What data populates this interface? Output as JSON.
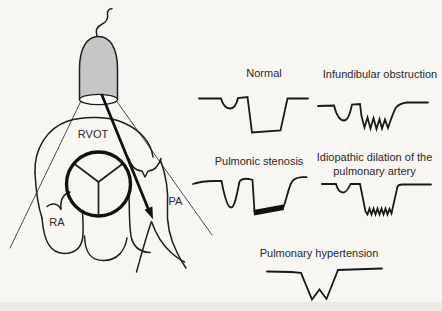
{
  "palette": {
    "background": "#f7f6f3",
    "ink": "#1e1e1e",
    "text": "#2a2a2a",
    "probe_fill": "#c6c6c6"
  },
  "heart_diagram": {
    "labels": {
      "rvot": "RVOT",
      "ra": "RA",
      "pa": "PA"
    },
    "paths": {
      "probe_body": "M 79.5,99 L 79.5,69 C 79.5,48 87,36.5 98.5,36.5 C 110,36.5 117.5,48 117.5,69 L 117.5,99 Z",
      "probe_face": "M 79.5,99.5 A 19,5.2 0 1 0 117.5,99.5 A 19,5.2 0 1 0 79.5,99.5 Z",
      "probe_cable": "M 97,36 C 95,30 97.5,26.5 101.5,24.5 C 106.5,22 108.5,18.5 107.5,14 C 107,11 109,9 112,8.5",
      "beam_left": "M 81,101 L 10,248",
      "beam_right": "M 116.5,101 L 212,235",
      "arrow_shaft": "M 101.5,94 L 149.5,212",
      "arrow_head": "M 153,219.3 L 152.4,206.6 L 144.6,209.8 Z",
      "heart_dome": "M 35,173 C 34,149 47,128 68,121 C 83,116 110,116 124,123 C 140,130 151,142 153,157",
      "heart_left_wall": "M 35,173 C 36,193 38,206 42,218",
      "ra_lobe": "M 42,218 C 44,243 51,253 64,253.5 C 76.5,253.5 82.5,246 83,234 C 83.3,227 83,220 82.5,213",
      "rv_lobe": "M 84.5,236 C 85,253 91,260.5 103.5,260.5 C 117,260.5 125,251 127,238",
      "rv_right_edge": "M 129,192 C 129.5,210 129,225 131,236 C 133,247 140,252 150,252.5",
      "left_scallop": "M 70,192 C 62.5,194.5 60,201 61,209.5 C 57.5,203 51.5,202.5 47,206.5",
      "right_scallop": "M 128.5,158 C 131.5,167 136.5,171 142,171 L 145,177 L 148,171 C 154,171 158.5,166 161,158.5",
      "pa_notch": "M 136.5,272 C 141,256 146,237 151.5,221.5 C 155.5,233 162,244.5 171,252.5 C 175,256 179.5,259.5 184.5,262",
      "pa_outer_wall": "M 160.5,160 C 166.5,177 168.5,192 167.5,206.5 C 166.5,221 170,239 177.5,253.5 C 179.5,257.5 182.5,263 186,268",
      "valve_cusps": "M 98.5,182 L 74,163.5 M 98.5,182 L 123,163.5 M 98.5,182 L 98.5,216"
    },
    "valve_circle": {
      "cx": 98.5,
      "cy": 184,
      "r": 32
    }
  },
  "tracings": [
    {
      "id": "normal",
      "label": "Normal",
      "path": "M 199,98.5 L 221,98.5 C 223,105.5 226,108.5 230,108.5 C 234,108.5 236.5,105 238,98 L 247.5,97 L 252,132.5 L 280.5,130.5 L 287.5,98.5 L 308,98.5"
    },
    {
      "id": "infundibular-obstruction",
      "label": "Infundibular obstruction",
      "path": "M 318,106 L 334,105.5 C 336,113.5 339.5,120.5 344,120.5 C 348.5,120.5 350.5,112 352,104.5 L 360,104 L 361.5,116 L 364.5,127.5 L 367.5,117.5 L 370.5,128.5 L 373.5,118 L 376.5,129 L 379.5,119 L 382,128.5 L 385,119.5 L 388,128 C 391,119 393.5,111.5 396,107.5 C 398.5,104.5 402,103 407,102.5 L 428,102.5"
    },
    {
      "id": "pulmonic-stenosis",
      "label": "Pulmonic stenosis",
      "path": "M 193,184 C 200,181.5 207,181 214,181 L 221.5,181 C 223.5,191.5 227,207.5 231,207.5 C 235,207.5 237.5,191 239.5,181.5 C 241.5,179 245.5,178.5 248.5,179 L 252.5,180 L 254.5,211.5 M 283.5,207 C 286.5,199 288.5,188.5 291,183.5 C 292.5,179.5 297.5,177.5 302,177.2 L 306.5,177.2",
      "thick_segment": "M 253.5,210 L 283.5,204.5 L 284,210 L 254,215.5 Z"
    },
    {
      "id": "idiopathic-dilation",
      "label": "Idiopathic dilation of the pulmonary artery",
      "label_lines": [
        "Idiopathic dilation of the",
        "pulmonary artery"
      ],
      "path": "M 322,184 L 336,184 C 337.5,189.5 340,192.5 343,192.5 C 346,192.5 348.5,188.5 350.5,184 L 360,184 L 365.5,211.5 L 367.5,214.5 L 369.5,208.5 L 371.5,214.5 L 373.5,208.5 L 375.5,214.5 L 377.5,208.5 L 379.5,214.5 L 381.5,208.5 L 383.5,214.5 L 385.5,208.5 L 387.5,214.5 L 389.5,209 L 391.5,213.5 L 397.5,186.5 C 398.5,184.8 400,184.5 402,184.5 L 431,184.5"
    },
    {
      "id": "pulmonary-hypertension",
      "label": "Pulmonary hypertension",
      "path": "M 267,271.5 L 291,272 L 301,272.8 L 312,299.5 L 319.5,289.5 L 326.5,299 L 338,270 L 382,268.5"
    }
  ]
}
